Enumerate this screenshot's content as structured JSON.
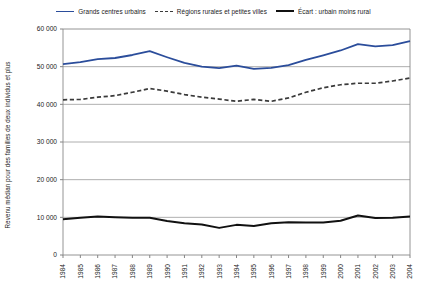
{
  "chart_data": {
    "type": "line",
    "title": "",
    "xlabel": "",
    "ylabel": "Revenu médian pour des familles de deux individus et plus",
    "ylim": [
      0,
      60000
    ],
    "ytick_labels": [
      "60 000",
      "50 000",
      "40 000",
      "30 000",
      "20 000",
      "10 000",
      "0"
    ],
    "ytick_values": [
      60000,
      50000,
      40000,
      30000,
      20000,
      10000,
      0
    ],
    "grid": true,
    "legend_position": "top-center",
    "categories": [
      "1984",
      "1985",
      "1986",
      "1987",
      "1988",
      "1989",
      "1990",
      "1991",
      "1992",
      "1993",
      "1994",
      "1995",
      "1996",
      "1997",
      "1998",
      "1999",
      "2000",
      "2001",
      "2002",
      "2003",
      "2004"
    ],
    "series": [
      {
        "name": "Grands centres urbains",
        "color": "#2b4d9b",
        "style": "solid",
        "values": [
          50700,
          51200,
          52000,
          52300,
          53100,
          54100,
          52500,
          51000,
          50000,
          49600,
          50300,
          49400,
          49700,
          50400,
          51800,
          53000,
          54300,
          56000,
          55400,
          55700,
          56800
        ]
      },
      {
        "name": "Régions rurales et petites villes",
        "color": "#3a3a3a",
        "style": "dashed",
        "values": [
          41200,
          41300,
          41900,
          42300,
          43200,
          44200,
          43500,
          42600,
          41900,
          41400,
          40800,
          41300,
          40800,
          41700,
          43200,
          44400,
          45200,
          45600,
          45600,
          46200,
          47000
        ]
      },
      {
        "name": "Écart : urbain moins rural",
        "color": "#111111",
        "style": "solid",
        "values": [
          9500,
          9900,
          10200,
          10000,
          9900,
          9900,
          9000,
          8400,
          8100,
          7200,
          8000,
          7700,
          8400,
          8700,
          8600,
          8600,
          9100,
          10500,
          9800,
          9900,
          10200
        ]
      }
    ]
  },
  "legend": {
    "entries": [
      {
        "label": "Grands centres urbains",
        "icon": "solid-blue-line-icon"
      },
      {
        "label": "Régions rurales et petites villes",
        "icon": "dashed-gray-line-icon"
      },
      {
        "label": "Écart : urbain moins rural",
        "icon": "solid-black-line-icon"
      }
    ]
  }
}
